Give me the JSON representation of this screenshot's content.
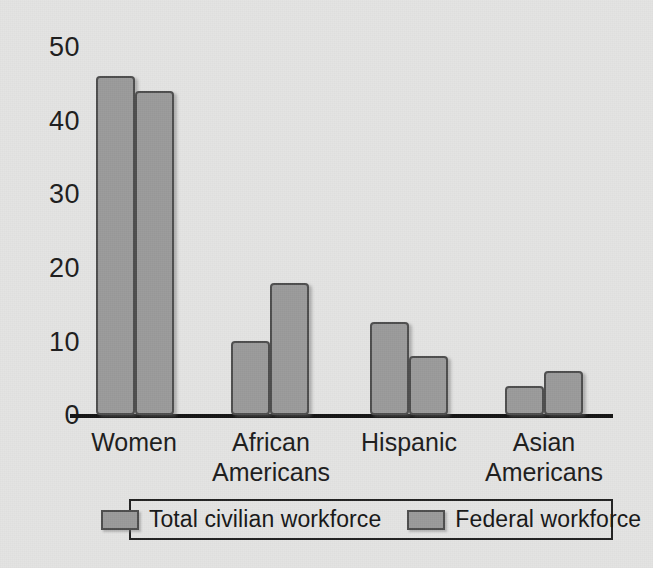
{
  "chart_data": {
    "type": "bar",
    "title": "",
    "subtitle": "",
    "xlabel": "",
    "ylabel": "",
    "ylim": [
      0,
      50
    ],
    "yticks": [
      0,
      10,
      20,
      30,
      40,
      50
    ],
    "ytick_labels": [
      "0",
      "10",
      "20",
      "30",
      "40",
      "50"
    ],
    "grid": false,
    "legend_position": "bottom",
    "categories": [
      "Women",
      "African Americans",
      "Hispanic",
      "Asian Americans"
    ],
    "category_lines": [
      [
        "Women"
      ],
      [
        "African",
        "Americans"
      ],
      [
        "Hispanic"
      ],
      [
        "Asian",
        "Americans"
      ]
    ],
    "series": [
      {
        "name": "Total civilian workforce",
        "values": [
          46,
          10,
          12.6,
          4
        ],
        "color": "#9b9b9b"
      },
      {
        "name": "Federal workforce",
        "values": [
          44,
          18,
          8,
          6
        ],
        "color": "#9b9b9b"
      }
    ]
  },
  "legend": {
    "entries": [
      {
        "label": "Total civilian workforce"
      },
      {
        "label": "Federal workforce"
      }
    ]
  },
  "colors": {
    "background": "#e4e4e3",
    "bar_fill": "#9b9b9b",
    "bar_stroke": "#4e4e4e",
    "axis": "#141414",
    "text": "#1d1d1d"
  }
}
